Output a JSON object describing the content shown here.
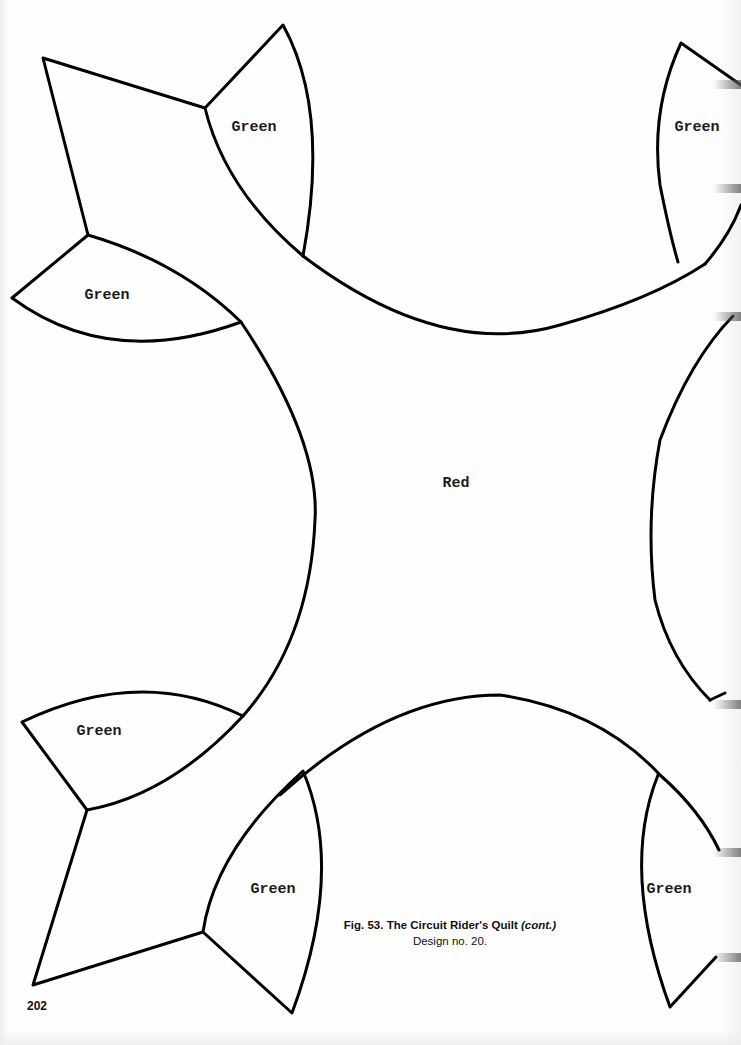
{
  "page": {
    "number": "202",
    "background": "#ffffff",
    "line_color": "#000000"
  },
  "figure": {
    "caption_title": "Fig. 53. The Circuit Rider's Quilt",
    "caption_cont": "(cont.)",
    "caption_subtitle": "Design no. 20."
  },
  "pieces": {
    "center": {
      "label": "Red"
    },
    "green_top_left_upper": {
      "label": "Green"
    },
    "green_top_right": {
      "label": "Green"
    },
    "green_left_upper": {
      "label": "Green"
    },
    "green_left_lower": {
      "label": "Green"
    },
    "green_bottom_left": {
      "label": "Green"
    },
    "green_bottom_right": {
      "label": "Green"
    }
  }
}
